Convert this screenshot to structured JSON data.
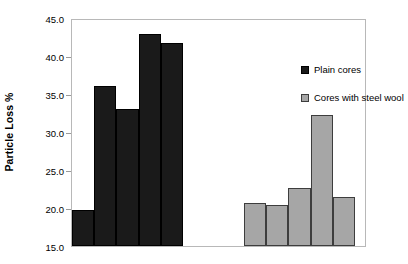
{
  "chart_data": {
    "type": "bar",
    "title": "",
    "xlabel": "",
    "ylabel": "Particle Loss %",
    "ylim": [
      15.0,
      45.0
    ],
    "ytick_labels": [
      "45.0",
      "40.0",
      "35.0",
      "30.0",
      "25.0",
      "20.0",
      "15.0"
    ],
    "ytick_values": [
      45.0,
      40.0,
      35.0,
      30.0,
      25.0,
      20.0,
      15.0
    ],
    "xtick_labels": [],
    "grid": false,
    "legend_position": "upper-right-inside",
    "series": [
      {
        "name": "Plain cores",
        "color": "#1a1a1a",
        "values": [
          19.7,
          36.0,
          33.0,
          42.9,
          41.7
        ]
      },
      {
        "name": "Cores with steel wool",
        "color": "#a6a6a6",
        "values": [
          20.6,
          20.4,
          22.6,
          32.2,
          21.4
        ]
      }
    ]
  },
  "legend": {
    "entries": [
      {
        "label": "Plain cores",
        "swatch": "plain"
      },
      {
        "label": "Cores with steel wool",
        "swatch": "wool"
      }
    ]
  },
  "axis": {
    "y_title": "Particle Loss %"
  }
}
